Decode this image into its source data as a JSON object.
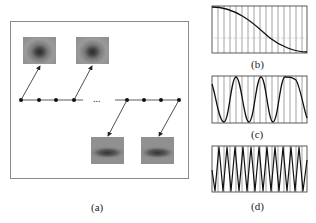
{
  "figure": {
    "panels": [
      {
        "id": "a",
        "label": "(a)",
        "description": "Time sequence of mouth frames"
      },
      {
        "id": "b",
        "label": "(b)",
        "description": "Low-frequency basis (half cosine)"
      },
      {
        "id": "c",
        "label": "(c)",
        "description": "Medium-frequency sinusoid"
      },
      {
        "id": "d",
        "label": "(d)",
        "description": "High-frequency sinusoid"
      }
    ],
    "timeline": {
      "ellipsis": "...",
      "left_dots": 4,
      "right_dots": 4
    },
    "mouth_images": [
      {
        "name": "mouth-frame-1",
        "state": "open"
      },
      {
        "name": "mouth-frame-2",
        "state": "open-round"
      },
      {
        "name": "mouth-frame-3",
        "state": "closed"
      },
      {
        "name": "mouth-frame-4",
        "state": "closed"
      }
    ]
  }
}
